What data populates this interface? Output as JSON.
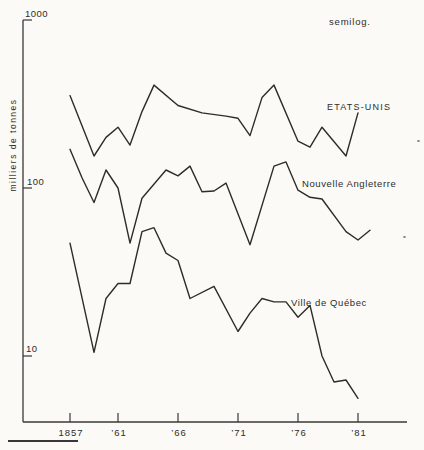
{
  "chart_data": {
    "type": "line",
    "scale": "semilog",
    "annotation": "semilog.",
    "title": "",
    "xlabel": "",
    "ylabel": "milliers de tonnes",
    "xlim": [
      1853,
      1885
    ],
    "ylim": [
      4,
      1000
    ],
    "grid": false,
    "legend_position": "inline-labels-right",
    "y_ticks": [
      {
        "value": 1000,
        "label": "1000"
      },
      {
        "value": 100,
        "label": "100"
      },
      {
        "value": 10,
        "label": "10"
      }
    ],
    "x_ticks": [
      {
        "year": 1857,
        "label": "1857"
      },
      {
        "year": 1861,
        "label": "’61"
      },
      {
        "year": 1866,
        "label": "’66"
      },
      {
        "year": 1871,
        "label": "’71"
      },
      {
        "year": 1876,
        "label": "’76"
      },
      {
        "year": 1881,
        "label": "’81"
      }
    ],
    "series": [
      {
        "name": "ETATS-UNIS",
        "x": [
          1857,
          1859,
          1860,
          1861,
          1862,
          1863,
          1864,
          1866,
          1868,
          1870,
          1871,
          1872,
          1873,
          1874,
          1876,
          1877,
          1878,
          1880,
          1881
        ],
        "values": [
          355,
          155,
          200,
          230,
          180,
          285,
          410,
          310,
          280,
          268,
          260,
          205,
          345,
          410,
          190,
          175,
          230,
          155,
          280
        ]
      },
      {
        "name": "Nouvelle Angleterre",
        "x": [
          1857,
          1858,
          1859,
          1860,
          1861,
          1862,
          1863,
          1865,
          1866,
          1867,
          1868,
          1869,
          1870,
          1872,
          1874,
          1875,
          1876,
          1877,
          1878,
          1880,
          1881,
          1882
        ],
        "values": [
          170,
          115,
          82,
          128,
          100,
          47,
          87,
          128,
          118,
          135,
          95,
          96,
          107,
          46,
          135,
          143,
          97,
          88,
          86,
          55,
          49,
          56
        ]
      },
      {
        "name": "Ville de Québec",
        "x": [
          1857,
          1859,
          1860,
          1861,
          1862,
          1863,
          1864,
          1865,
          1866,
          1867,
          1869,
          1871,
          1872,
          1873,
          1874,
          1875,
          1876,
          1877,
          1878,
          1879,
          1880,
          1881
        ],
        "values": [
          47,
          10.5,
          22,
          27,
          27,
          55,
          58,
          41,
          37,
          22,
          26,
          14,
          18,
          22,
          21,
          21,
          17,
          20,
          10,
          7,
          7.2,
          5.6
        ]
      }
    ]
  },
  "layout": {
    "colors": {
      "line": "#2e2c29",
      "axis": "#3a3836",
      "text": "#2e2c29",
      "background": "#fbfaf7"
    },
    "scale": {
      "baseYear": 1857,
      "x0": 70,
      "pxPerYear": 12,
      "y100": 188,
      "pxPerDecade": 168
    },
    "axes": {
      "yAxisX": 23,
      "yTop": 20,
      "yBottom": 422,
      "xRight": 407,
      "yTickLen": 9,
      "xTickTop": 413
    },
    "labels": {
      "semilog": {
        "x": 329,
        "y": 25,
        "size": 9.5,
        "spacing": 0.8
      },
      "ylabel": {
        "x": 16,
        "y": 145,
        "size": 8.5,
        "spacing": 1.5
      },
      "series": [
        {
          "x": 327,
          "y": 110,
          "size": 9,
          "spacing": 1.2
        },
        {
          "x": 302,
          "y": 187,
          "size": 9.5,
          "spacing": 0.6
        },
        {
          "x": 291,
          "y": 306,
          "size": 9.5,
          "spacing": 0.6
        }
      ],
      "yTickLabels": [
        {
          "x": 25,
          "y": 17
        },
        {
          "x": 27,
          "y": 185
        },
        {
          "x": 26,
          "y": 352
        }
      ],
      "xTickLabelY": 436
    },
    "bottomRule": {
      "x": 8,
      "y": 440,
      "width": 70,
      "height": 1.6
    },
    "artifactDots": [
      {
        "x": 417,
        "y": 140
      },
      {
        "x": 403,
        "y": 236
      }
    ]
  }
}
